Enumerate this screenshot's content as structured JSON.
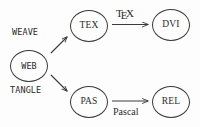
{
  "diagram": {
    "background_color": "#fdfdfd",
    "stroke_color": "#3a3a3a",
    "text_color": "#2b2b2b",
    "nodes": [
      {
        "id": "web",
        "label": "WEB",
        "x": 10,
        "y": 50
      },
      {
        "id": "tex",
        "label": "TEX",
        "x": 70,
        "y": 10
      },
      {
        "id": "dvi",
        "label": "DVI",
        "x": 152,
        "y": 9
      },
      {
        "id": "pas",
        "label": "PAS",
        "x": 70,
        "y": 86
      },
      {
        "id": "rel",
        "label": "REL",
        "x": 152,
        "y": 86
      }
    ],
    "edges": [
      {
        "id": "weave",
        "from": "web",
        "to": "tex",
        "label": "WEAVE",
        "style": "mono",
        "direction": "up-right"
      },
      {
        "id": "tangle",
        "from": "web",
        "to": "pas",
        "label": "TANGLE",
        "style": "mono",
        "direction": "down-right"
      },
      {
        "id": "tex-run",
        "from": "tex",
        "to": "dvi",
        "label": "TeX",
        "style": "logo",
        "direction": "right"
      },
      {
        "id": "pascal",
        "from": "pas",
        "to": "rel",
        "label": "Pascal",
        "style": "roman",
        "direction": "right"
      }
    ],
    "tex_logo": {
      "t": "T",
      "e": "E",
      "x": "X"
    }
  }
}
